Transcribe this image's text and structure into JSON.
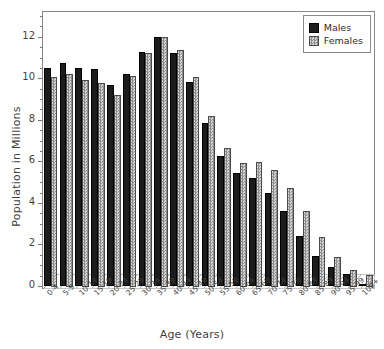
{
  "chart_data": {
    "type": "bar",
    "title": "",
    "xlabel": "Age (Years)",
    "ylabel": "Population in Millions",
    "ylim": [
      0,
      13
    ],
    "yticks": [
      0,
      2,
      4,
      6,
      8,
      10,
      12
    ],
    "ytick_labels": [
      "0",
      "2",
      "4",
      "6",
      "8",
      "10",
      "12"
    ],
    "grid": false,
    "legend_position": "top-right",
    "categories": [
      "0-4",
      "5-9",
      "10-14",
      "15-19",
      "20-24",
      "25-29",
      "30-34",
      "35-39",
      "40-44",
      "45-49",
      "50-54",
      "55-59",
      "60-64",
      "65-69",
      "70-74",
      "75-79",
      "80-84",
      "85-89",
      "90-94",
      "95-99",
      "100+"
    ],
    "series": [
      {
        "name": "Males",
        "color": "#1c1c1c",
        "values": [
          10.5,
          10.75,
          10.5,
          10.45,
          9.7,
          10.2,
          11.25,
          12.0,
          11.2,
          9.8,
          7.85,
          6.25,
          5.45,
          5.2,
          4.5,
          3.6,
          2.4,
          1.45,
          0.9,
          0.6,
          0.1
        ]
      },
      {
        "name": "Females",
        "color": "#bdbdbd",
        "values": [
          10.1,
          10.25,
          10.0,
          9.85,
          9.25,
          10.15,
          11.3,
          12.05,
          11.4,
          10.1,
          8.25,
          6.7,
          6.0,
          6.05,
          5.65,
          4.8,
          3.65,
          2.4,
          1.45,
          0.85,
          0.6
        ]
      }
    ]
  },
  "legend": {
    "entries": [
      {
        "label": "Males",
        "swatch": "dark-solid-swatch"
      },
      {
        "label": "Females",
        "swatch": "gray-hatched-swatch"
      }
    ]
  },
  "axes": {
    "y_title": "Population in Millions",
    "x_title": "Age (Years)"
  }
}
